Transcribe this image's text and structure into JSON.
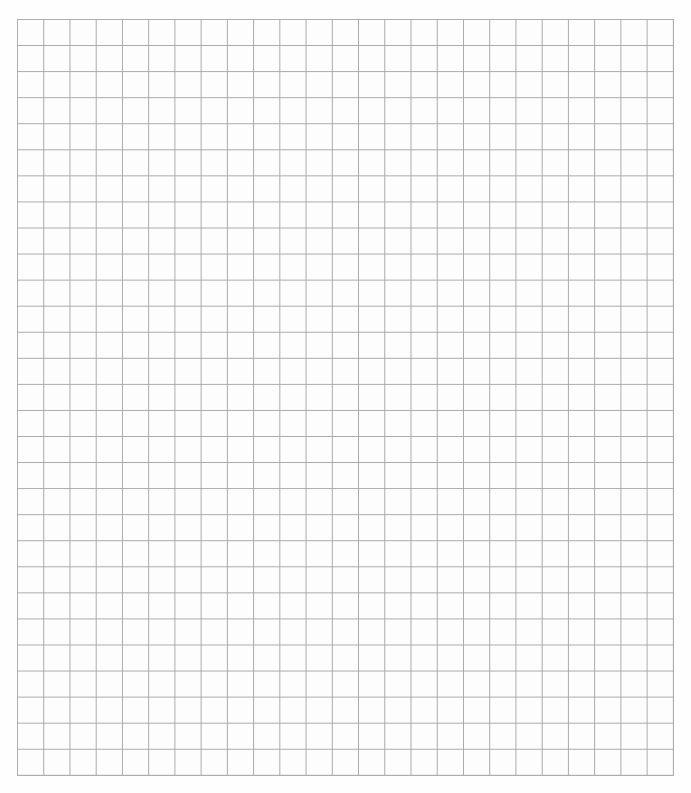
{
  "document": {
    "kind": "graph-paper",
    "description": "Blank square-ruled graph paper sheet",
    "text_content": "",
    "width_px": 691,
    "height_px": 793
  },
  "page": {
    "background_color": "#ffffff",
    "paper_color": "#fefefe"
  },
  "grid": {
    "columns": 25,
    "rows": 29,
    "cell_width_px": 26.24,
    "cell_height_px": 26.07,
    "origin_x_px": 17,
    "origin_y_px": 19,
    "width_px": 656,
    "height_px": 756,
    "line_color": "#a9a9a9",
    "line_width_px": 1,
    "cell_background_color": "#fdfdfd"
  },
  "margins": {
    "left_px": 17,
    "top_px": 19,
    "right_px": 18,
    "bottom_px": 18,
    "color": "#ffffff"
  },
  "annotations": {
    "labels": [],
    "axis_ticks": [],
    "legend": [],
    "marks": []
  }
}
